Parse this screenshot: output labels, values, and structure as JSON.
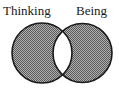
{
  "diagram": {
    "type": "venn",
    "sets": [
      {
        "label": "Thinking",
        "shaded": true
      },
      {
        "label": "Being",
        "shaded": true
      }
    ],
    "intersection": {
      "shaded": false
    },
    "colors": {
      "fill": "#8c8c8c",
      "stroke": "#1a1a1a",
      "intersection": "#ffffff",
      "background": "#ffffff"
    }
  }
}
